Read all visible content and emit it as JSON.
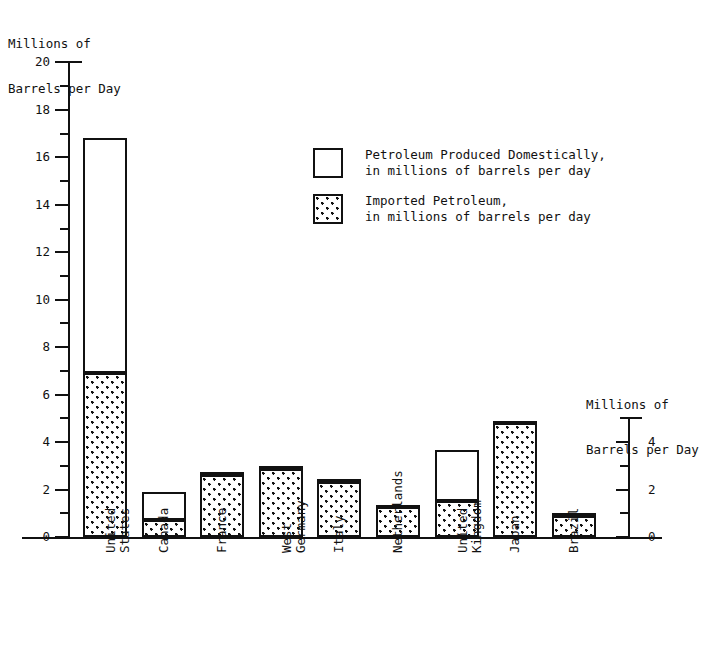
{
  "chart_data": {
    "type": "bar",
    "stacked": true,
    "title": "",
    "xlabel": "",
    "ylabel": "Millions of\nBarrels per Day",
    "ylabel_right": "Millions of\nBarrels per Day",
    "ylim": [
      0,
      20
    ],
    "ylim_right": [
      0,
      5
    ],
    "grid": false,
    "legend_position": "upper-center",
    "categories": [
      "United\nStates",
      "Canada",
      "France",
      "West\nGermany",
      "Italy",
      "Netherlands",
      "United\nKingdom",
      "Japan",
      "Brazil"
    ],
    "yticks_major": [
      0,
      2,
      4,
      6,
      8,
      10,
      12,
      14,
      16,
      18,
      20
    ],
    "yticks_minor": [
      1,
      3,
      5,
      7,
      9,
      11,
      13,
      15,
      17,
      19
    ],
    "ytick_labels": [
      "0",
      "2",
      "4",
      "6",
      "8",
      "10",
      "12",
      "14",
      "16",
      "18",
      "20"
    ],
    "yticks_major_right": [
      0,
      2,
      4
    ],
    "yticks_minor_right": [
      1,
      3,
      5
    ],
    "ytick_labels_right": [
      "0",
      "2",
      "4"
    ],
    "series": [
      {
        "name": "Imported Petroleum,\nin millions of barrels per day",
        "fill": "dotted",
        "values": [
          6.9,
          0.7,
          2.6,
          2.85,
          2.3,
          1.25,
          1.5,
          4.8,
          0.9
        ]
      },
      {
        "name": "Petroleum Produced Domestically,\nin millions of barrels per day",
        "fill": "white",
        "values": [
          9.9,
          1.2,
          0.15,
          0.15,
          0.15,
          0.1,
          2.15,
          0.1,
          0.1
        ]
      }
    ],
    "totals": [
      16.8,
      1.9,
      2.75,
      3.0,
      2.45,
      1.35,
      3.65,
      4.9,
      1.0
    ]
  },
  "legend": {
    "items": [
      {
        "name": "legend-domestic",
        "swatch": "white",
        "line1": "Petroleum Produced Domestically,",
        "line2": "in millions of barrels per day"
      },
      {
        "name": "legend-imported",
        "swatch": "dotted",
        "line1": "Imported Petroleum,",
        "line2": "in millions of barrels per day"
      }
    ]
  },
  "axes": {
    "left_title_line1": "Millions of",
    "left_title_line2": "Barrels per Day",
    "right_title_line1": "Millions of",
    "right_title_line2": "Barrels per Day"
  },
  "colors": {
    "ink": "#111111",
    "background": "#ffffff",
    "domestic_fill": "#ffffff",
    "imported_fill": "#ffffff"
  }
}
